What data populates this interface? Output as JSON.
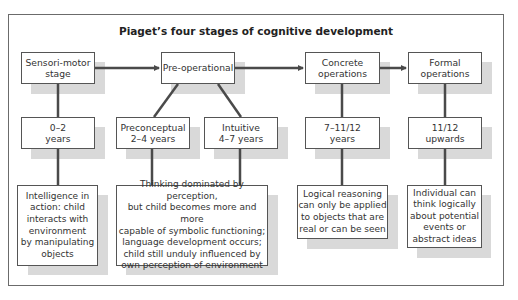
{
  "title": "Piaget’s four stages of cognitive development",
  "colors": {
    "line": "#4a4a4a",
    "box_border": "#555555",
    "shadow": "#d9d9d9",
    "frame": "#6b6b6b"
  },
  "stages": [
    {
      "label": "Sensori-motor\nstage"
    },
    {
      "label": "Pre-operational"
    },
    {
      "label": "Concrete\noperations"
    },
    {
      "label": "Formal\noperations"
    }
  ],
  "ages": [
    {
      "label": "0–2\nyears"
    },
    {
      "label": "Preconceptual\n2–4 years"
    },
    {
      "label": "Intuitive\n4–7 years"
    },
    {
      "label": "7–11/12\nyears"
    },
    {
      "label": "11/12\nupwards"
    }
  ],
  "descriptions": [
    {
      "text": "Intelligence in\naction: child\ninteracts with\nenvironment\nby manipulating\nobjects"
    },
    {
      "text": "Thinking dominated by perception,\nbut child becomes more and more\ncapable of symbolic functioning;\nlanguage development occurs;\nchild still unduly influenced by\nown perception of environment"
    },
    {
      "text": "Logical reasoning\ncan only be applied\nto objects that are\nreal or can be seen"
    },
    {
      "text": "Individual can\nthink logically\nabout potential\nevents or\nabstract ideas"
    }
  ]
}
